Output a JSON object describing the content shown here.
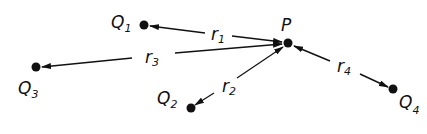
{
  "diagram": {
    "points": {
      "P": {
        "label": "P",
        "x": 288,
        "y": 43
      },
      "Q1": {
        "label": "Q",
        "sub": "1",
        "x": 144,
        "y": 25
      },
      "Q2": {
        "label": "Q",
        "sub": "2",
        "x": 191,
        "y": 108
      },
      "Q3": {
        "label": "Q",
        "sub": "3",
        "x": 36,
        "y": 67
      },
      "Q4": {
        "label": "Q",
        "sub": "4",
        "x": 393,
        "y": 89
      }
    },
    "vectors": {
      "r1": {
        "label": "r",
        "sub": "1"
      },
      "r2": {
        "label": "r",
        "sub": "2"
      },
      "r3": {
        "label": "r",
        "sub": "3"
      },
      "r4": {
        "label": "r",
        "sub": "4"
      }
    },
    "colors": {
      "ink": "#111111",
      "background": "#ffffff"
    }
  }
}
